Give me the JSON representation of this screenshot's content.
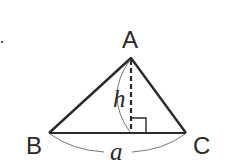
{
  "diagram": {
    "type": "triangle-area",
    "vertices": {
      "A": {
        "label": "A",
        "x": 131,
        "y": 58
      },
      "B": {
        "label": "B",
        "x": 49,
        "y": 133
      },
      "C": {
        "label": "C",
        "x": 186,
        "y": 133
      }
    },
    "height": {
      "label": "h",
      "style": "dashed",
      "foot_x": 131
    },
    "base": {
      "label": "a"
    },
    "right_angle_marker": true,
    "colors": {
      "stroke": "#2a2a2a",
      "arc": "#777777"
    }
  }
}
